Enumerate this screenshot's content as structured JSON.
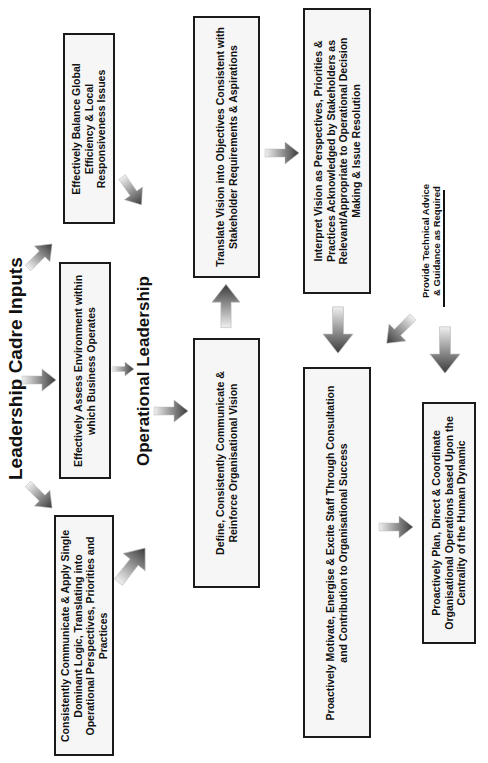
{
  "titles": {
    "leadership_cadre_inputs": "Leadership Cadre Inputs",
    "operational_leadership": "Operational Leadership"
  },
  "boxes": [
    {
      "id": "balance",
      "lines": [
        "Effectively Balance Global",
        "Efficiency & Local",
        "Responsiveness Issues"
      ]
    },
    {
      "id": "assess",
      "lines": [
        "Effectively Assess Environment within",
        "which Business Operates"
      ]
    },
    {
      "id": "communicate",
      "lines": [
        "Consistently Communicate & Apply Single",
        "Dominant Logic, Translating into",
        "Operational Perspectives, Priorities and",
        "Practices"
      ]
    },
    {
      "id": "translate",
      "lines": [
        "Translate Vision into Objectives Consistent with",
        "Stakeholder Requirements & Aspirations"
      ]
    },
    {
      "id": "define",
      "lines": [
        "Define, Consistently Communicate &",
        "Reinforce Organisational Vision"
      ]
    },
    {
      "id": "interpret",
      "lines": [
        "Interpret Vision as Perspectives, Priorities &",
        "Practices Acknowledged by Stakeholders as",
        "Relevant/Appropriate to  Operational Decision",
        "Making & Issue Resolution"
      ]
    },
    {
      "id": "motivate",
      "lines": [
        "Proactively Motivate, Energise & Excite Staff Through Consultation",
        "and Contribution to Organisational Success"
      ]
    },
    {
      "id": "plan",
      "lines": [
        "Proactively Plan, Direct & Coordinate",
        "Organisational Operations based Upon the",
        "Centrality of the Human Dynamic"
      ]
    }
  ],
  "annotation": {
    "lines": [
      "Provide Technical Advice",
      "& Guidance as Required"
    ]
  },
  "colors": {
    "border": "#1a1a1a",
    "box_fill": "#f6f6f6",
    "arrow_dark": "#3a3a3a",
    "arrow_light": "#eeeeee"
  }
}
